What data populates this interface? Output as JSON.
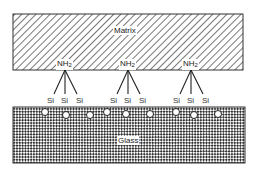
{
  "diagram": {
    "matrix_label": "Matrix",
    "glass_label": "Glass",
    "groups": [
      {
        "amine": "NH",
        "amine_sub": "2",
        "silicons": [
          "Si",
          "Si",
          "Si"
        ]
      },
      {
        "amine": "NH",
        "amine_sub": "2",
        "silicons": [
          "Si",
          "Si",
          "Si"
        ]
      },
      {
        "amine": "NH",
        "amine_sub": "2",
        "silicons": [
          "Si",
          "Si",
          "Si"
        ]
      }
    ],
    "surface_sites_count": 9
  }
}
